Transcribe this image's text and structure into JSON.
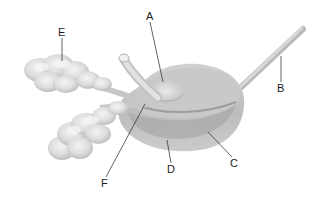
{
  "diagram": {
    "labels": [
      {
        "id": "A",
        "text": "A",
        "x": 147,
        "y": 20,
        "line": [
          150,
          22,
          163,
          82
        ]
      },
      {
        "id": "B",
        "text": "B",
        "x": 278,
        "y": 92,
        "line": [
          281,
          82,
          281,
          56
        ]
      },
      {
        "id": "C",
        "text": "C",
        "x": 231,
        "y": 166,
        "line": [
          232,
          157,
          208,
          132
        ]
      },
      {
        "id": "D",
        "text": "D",
        "x": 168,
        "y": 173,
        "line": [
          171,
          163,
          167,
          140
        ]
      },
      {
        "id": "E",
        "text": "E",
        "x": 58,
        "y": 36,
        "line": [
          62,
          38,
          62,
          61
        ]
      },
      {
        "id": "F",
        "text": "F",
        "x": 101,
        "y": 187,
        "line": [
          106,
          177,
          145,
          104
        ]
      }
    ]
  },
  "colors": {
    "background": "#ffffff",
    "gland_light": "#e6e6e6",
    "gland_mid": "#cfcfcf",
    "gland_dark": "#b4b4b4",
    "body_outer": "#bcbcbc",
    "body_inner": "#a8a8a8",
    "label": "#1e1e1e"
  }
}
